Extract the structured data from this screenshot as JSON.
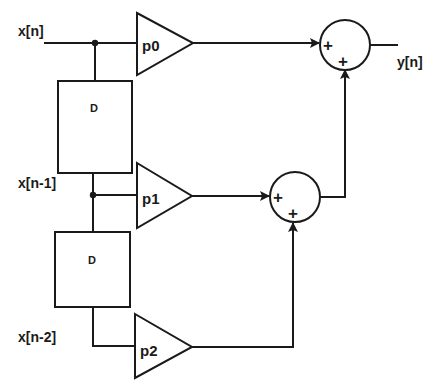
{
  "diagram": {
    "type": "FIR filter block diagram (direct form, 3 taps)",
    "signals": {
      "input": "x[n]",
      "delay1": "x[n-1]",
      "delay2": "x[n-2]",
      "output": "y[n]"
    },
    "delays": [
      {
        "label": "D"
      },
      {
        "label": "D"
      }
    ],
    "gains": [
      {
        "label": "p0"
      },
      {
        "label": "p1"
      },
      {
        "label": "p2"
      }
    ],
    "summers": [
      {
        "signs": [
          "+",
          "+"
        ]
      },
      {
        "signs": [
          "+",
          "+"
        ]
      }
    ],
    "colors": {
      "stroke": "#1a1a1a",
      "background": "#ffffff"
    }
  }
}
